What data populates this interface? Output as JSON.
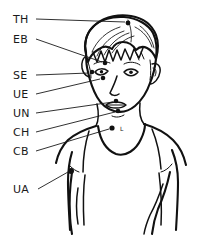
{
  "figure": {
    "ink_color": "#111111",
    "background_color": "#ffffff",
    "label_color": "#1a1a1a"
  },
  "labels": [
    {
      "id": "th",
      "text": "TH",
      "x": 13,
      "y": 23,
      "point_name": "top-of-head-point",
      "point_x": 128,
      "point_y": 23,
      "leader": "M 36 19 L 125 22"
    },
    {
      "id": "eb",
      "text": "EB",
      "x": 13,
      "y": 43,
      "point_name": "eyebrow-point",
      "point_x": 105,
      "point_y": 63,
      "leader": "M 36 39 L 102 62"
    },
    {
      "id": "se",
      "text": "SE",
      "x": 13,
      "y": 79,
      "point_name": "side-of-eye-point",
      "point_x": 92,
      "point_y": 72,
      "leader": "M 36 75 L 89 73"
    },
    {
      "id": "ue",
      "text": "UE",
      "x": 13,
      "y": 98,
      "point_name": "under-eye-point",
      "point_x": 103,
      "point_y": 78,
      "leader": "M 36 94 L 100 79"
    },
    {
      "id": "un",
      "text": "UN",
      "x": 13,
      "y": 117,
      "point_name": "under-nose-point",
      "point_x": 116,
      "point_y": 101,
      "leader": "M 36 113 L 113 102"
    },
    {
      "id": "ch",
      "text": "CH",
      "x": 13,
      "y": 136,
      "point_name": "chin-point",
      "point_x": 118,
      "point_y": 111,
      "leader": "M 36 132 L 115 112"
    },
    {
      "id": "cb",
      "text": "CB",
      "x": 13,
      "y": 155,
      "point_name": "collarbone-point",
      "point_x": 112,
      "point_y": 128,
      "leader": "M 36 151 L 109 129"
    },
    {
      "id": "ua",
      "text": "UA",
      "x": 13,
      "y": 193,
      "point_name": "under-arm-point",
      "point_x": 71,
      "point_y": 171,
      "leader": "M 38 189 L 68 172"
    }
  ],
  "inline_marks": [
    {
      "id": "l_mark",
      "text": "L",
      "x": 120,
      "y": 131,
      "note": "small letter beside the collarbone point"
    }
  ],
  "points": [
    {
      "name": "top-of-head-point",
      "x": 128,
      "y": 23,
      "r": 2.4
    },
    {
      "name": "eyebrow-point",
      "x": 105,
      "y": 63,
      "r": 2.3
    },
    {
      "name": "side-of-eye-point",
      "x": 92,
      "y": 72,
      "r": 2.3
    },
    {
      "name": "under-eye-point",
      "x": 103,
      "y": 78,
      "r": 2.3
    },
    {
      "name": "under-nose-point",
      "x": 116,
      "y": 101,
      "r": 2.3
    },
    {
      "name": "chin-point",
      "x": 118,
      "y": 111,
      "r": 2.3
    },
    {
      "name": "collarbone-point",
      "x": 112,
      "y": 128,
      "r": 2.6
    },
    {
      "name": "under-arm-point",
      "x": 71,
      "y": 171,
      "r": 3.0
    }
  ]
}
